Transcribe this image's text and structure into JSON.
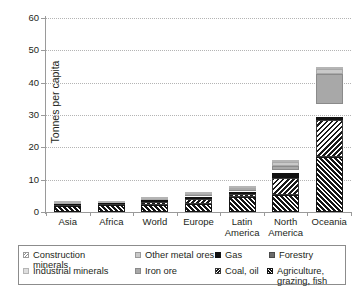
{
  "chart_data": {
    "type": "bar",
    "subtype": "stacked-bar",
    "title": "",
    "xlabel": "",
    "ylabel": "Tonnes per capita",
    "ylim": [
      0,
      60
    ],
    "yticks": [
      0,
      10,
      20,
      30,
      40,
      50,
      60
    ],
    "grid": true,
    "legend_position": "below",
    "categories": [
      "Asia",
      "Africa",
      "World",
      "Europe",
      "Latin America",
      "North America",
      "Oceania"
    ],
    "series": [
      {
        "name": "Agriculture, grazing, fish",
        "key": "agri",
        "color": "#1a1a1a",
        "pattern": "diagonal-hatch-dark",
        "values": [
          1.8,
          2.1,
          2.3,
          2.6,
          4.6,
          5.4,
          17.0
        ]
      },
      {
        "name": "Coal, oil",
        "key": "coal",
        "color": "#ffffff",
        "pattern": "diagonal-hatch-light",
        "values": [
          0.5,
          0.4,
          0.9,
          1.5,
          1.1,
          5.2,
          11.5
        ]
      },
      {
        "name": "Gas",
        "key": "gas",
        "color": "#121212",
        "pattern": "solid",
        "values": [
          0.1,
          0.1,
          0.2,
          0.4,
          0.3,
          1.4,
          0.8
        ]
      },
      {
        "name": "Forestry",
        "key": "forestry",
        "color": "#6b6b6b",
        "pattern": "solid",
        "values": [
          0.1,
          0.1,
          0.2,
          0.5,
          0.4,
          1.0,
          4.0
        ]
      },
      {
        "name": "Iron ore",
        "key": "iron",
        "color": "#a8a8a8",
        "pattern": "solid",
        "values": [
          0.1,
          0.1,
          0.2,
          0.3,
          0.5,
          1.2,
          9.5
        ]
      },
      {
        "name": "Other metal ores",
        "key": "othermetal",
        "color": "#c9c9c9",
        "pattern": "solid",
        "values": [
          0.1,
          0.1,
          0.2,
          0.3,
          0.4,
          1.4,
          1.4
        ]
      },
      {
        "name": "Industrial minerals",
        "key": "industrial",
        "color": "#dedede",
        "pattern": "solid",
        "values": [
          0.1,
          0.1,
          0.1,
          0.2,
          0.2,
          0.4,
          0.6
        ]
      },
      {
        "name": "Construction minerals",
        "key": "construction",
        "color": "#ffffff",
        "pattern": "diagonal-hatch-grey",
        "values": [
          0.8,
          1.2,
          2.2,
          2.9,
          3.0,
          13.5,
          9.7
        ]
      }
    ],
    "totals": [
      3.6,
      4.2,
      6.3,
      8.7,
      10.5,
      29.5,
      54.5
    ]
  },
  "axis": {
    "ytick_labels": [
      "0",
      "10",
      "20",
      "30",
      "40",
      "50",
      "60"
    ],
    "xtick_labels": [
      {
        "line1": "Asia",
        "line2": ""
      },
      {
        "line1": "Africa",
        "line2": ""
      },
      {
        "line1": "World",
        "line2": ""
      },
      {
        "line1": "Europe",
        "line2": ""
      },
      {
        "line1": "Latin",
        "line2": "America"
      },
      {
        "line1": "North",
        "line2": "America"
      },
      {
        "line1": "Oceania",
        "line2": ""
      }
    ],
    "ylabel": "Tonnes per capita"
  },
  "legend": {
    "row1": [
      {
        "label": "Construction minerals",
        "key": "constr"
      },
      {
        "label": "Other metal ores",
        "key": "othermetal"
      },
      {
        "label": "Gas",
        "key": "gas"
      },
      {
        "label": "Forestry",
        "key": "forest"
      }
    ],
    "row2": [
      {
        "label": "Industrial minerals",
        "key": "industrial"
      },
      {
        "label": "Iron ore",
        "key": "iron"
      },
      {
        "label": "Coal, oil",
        "key": "coal"
      },
      {
        "label": "Agriculture, grazing, fish",
        "key": "agri"
      }
    ]
  },
  "caption": ""
}
